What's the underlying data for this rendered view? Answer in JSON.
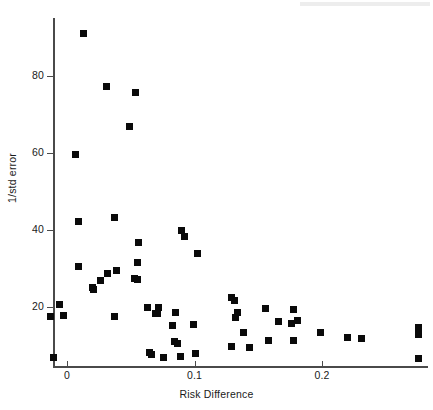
{
  "figure": {
    "background_color": "#ffffff",
    "marker_color": "#0a0a0a",
    "axis_color": "#4a4a4a"
  },
  "chart_data": {
    "type": "scatter",
    "title": "",
    "xlabel": "Risk Difference",
    "ylabel": "1/std error",
    "xlim": [
      -0.017,
      0.285
    ],
    "ylim": [
      5,
      93
    ],
    "xticks": [
      0,
      0.1,
      0.2
    ],
    "xtick_labels": [
      "0",
      "0.1",
      "0.2"
    ],
    "yticks": [
      20,
      40,
      60,
      80
    ],
    "ytick_labels": [
      "20",
      "40",
      "60",
      "80"
    ],
    "grid": false,
    "legend": null,
    "series": [
      {
        "name": "studies",
        "marker": "square",
        "color": "#0a0a0a",
        "points": [
          [
            0.013,
            91.0
          ],
          [
            0.031,
            77.4
          ],
          [
            0.054,
            75.7
          ],
          [
            0.049,
            66.9
          ],
          [
            0.007,
            59.7
          ],
          [
            0.037,
            43.3
          ],
          [
            0.009,
            42.3
          ],
          [
            0.09,
            39.8
          ],
          [
            0.092,
            38.3
          ],
          [
            0.056,
            36.8
          ],
          [
            0.102,
            33.9
          ],
          [
            0.055,
            31.7
          ],
          [
            0.009,
            30.6
          ],
          [
            0.039,
            29.5
          ],
          [
            0.032,
            28.6
          ],
          [
            0.053,
            27.4
          ],
          [
            0.055,
            27.2
          ],
          [
            0.026,
            26.8
          ],
          [
            0.02,
            25.2
          ],
          [
            0.021,
            24.5
          ],
          [
            0.129,
            22.5
          ],
          [
            0.131,
            21.7
          ],
          [
            -0.006,
            20.7
          ],
          [
            0.063,
            19.9
          ],
          [
            0.072,
            19.8
          ],
          [
            0.156,
            19.6
          ],
          [
            0.178,
            19.3
          ],
          [
            0.134,
            18.7
          ],
          [
            0.085,
            18.6
          ],
          [
            0.071,
            18.4
          ],
          [
            0.069,
            18.3
          ],
          [
            -0.003,
            17.9
          ],
          [
            -0.013,
            17.6
          ],
          [
            0.037,
            17.5
          ],
          [
            0.132,
            17.3
          ],
          [
            0.181,
            16.6
          ],
          [
            0.166,
            16.2
          ],
          [
            0.176,
            15.6
          ],
          [
            0.099,
            15.4
          ],
          [
            0.083,
            15.3
          ],
          [
            0.276,
            14.8
          ],
          [
            0.138,
            13.5
          ],
          [
            0.199,
            13.4
          ],
          [
            0.276,
            12.9
          ],
          [
            0.22,
            12.2
          ],
          [
            0.231,
            11.8
          ],
          [
            0.158,
            11.4
          ],
          [
            0.178,
            11.3
          ],
          [
            0.084,
            11.1
          ],
          [
            0.087,
            10.6
          ],
          [
            0.129,
            9.7
          ],
          [
            0.143,
            9.5
          ],
          [
            0.065,
            8.2
          ],
          [
            0.066,
            7.6
          ],
          [
            0.101,
            7.9
          ],
          [
            0.089,
            7.1
          ],
          [
            0.076,
            6.8
          ],
          [
            -0.011,
            6.8
          ],
          [
            0.276,
            6.6
          ]
        ]
      }
    ]
  }
}
